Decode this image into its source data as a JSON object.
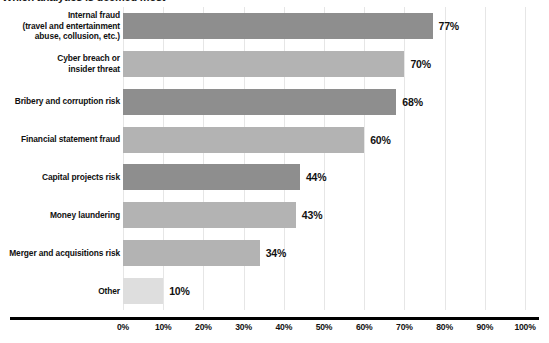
{
  "chart_data": {
    "type": "bar",
    "orientation": "horizontal",
    "title": "Which analytics is deemed most",
    "title_truncated": true,
    "categories": [
      "Internal fraud\n(travel and entertainment\nabuse, collusion, etc.)",
      "Cyber breach or\ninsider threat",
      "Bribery and corruption risk",
      "Financial statement fraud",
      "Capital projects risk",
      "Money laundering",
      "Merger and acquisitions risk",
      "Other"
    ],
    "values": [
      77,
      70,
      68,
      60,
      44,
      43,
      34,
      10
    ],
    "value_labels": [
      "77%",
      "70%",
      "68%",
      "60%",
      "44%",
      "43%",
      "34%",
      "10%"
    ],
    "xlabel": "",
    "ylabel": "",
    "xlim": [
      0,
      100
    ],
    "xticks": [
      0,
      10,
      20,
      30,
      40,
      50,
      60,
      70,
      80,
      90,
      100
    ],
    "xtick_labels": [
      "0%",
      "10%",
      "20%",
      "30%",
      "40%",
      "50%",
      "60%",
      "70%",
      "80%",
      "90%",
      "100%"
    ],
    "grid": true,
    "grid_axis": "x",
    "legend": null,
    "bar_colors": [
      "#8e8e8e",
      "#b3b3b3",
      "#8e8e8e",
      "#b3b3b3",
      "#8e8e8e",
      "#b3b3b3",
      "#b3b3b3",
      "#dedede"
    ],
    "colors": {
      "background": "#ffffff",
      "gridline": "#e6e6e6",
      "axis": "#000000",
      "text": "#111111",
      "bar_dark": "#8e8e8e",
      "bar_light": "#b3b3b3",
      "bar_pale": "#dedede"
    }
  }
}
